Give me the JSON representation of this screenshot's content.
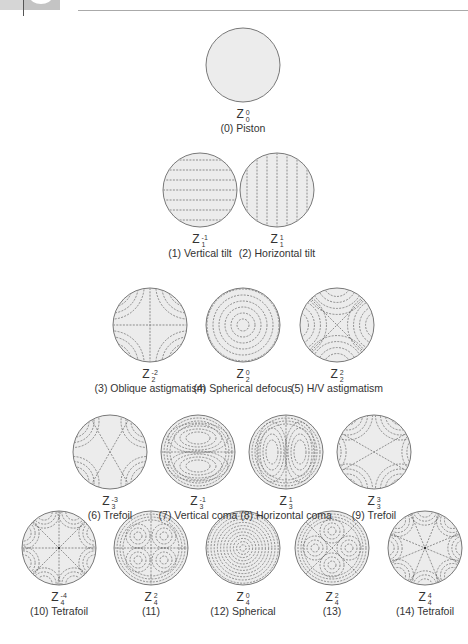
{
  "page": {
    "header": {
      "rule": true
    }
  },
  "figure": {
    "type": "zernike-pyramid",
    "symbol": "Z",
    "rows": [
      [
        {
          "index": 0,
          "m": "0",
          "n": "0",
          "caption": "(0) Piston",
          "pattern": "piston",
          "cx": 243,
          "cy": 65
        }
      ],
      [
        {
          "index": 1,
          "m": "-1",
          "n": "1",
          "caption": "(1) Vertical tilt",
          "pattern": "vtilt",
          "cx": 200,
          "cy": 190
        },
        {
          "index": 2,
          "m": "1",
          "n": "1",
          "caption": "(2) Horizontal tilt",
          "pattern": "htilt",
          "cx": 277,
          "cy": 190
        }
      ],
      [
        {
          "index": 3,
          "m": "-2",
          "n": "2",
          "caption": "(3) Oblique astigmatism",
          "pattern": "oblique-astig",
          "cx": 150,
          "cy": 325
        },
        {
          "index": 4,
          "m": "0",
          "n": "2",
          "caption": "(4) Spherical defocus",
          "pattern": "defocus",
          "cx": 243,
          "cy": 325
        },
        {
          "index": 5,
          "m": "2",
          "n": "2",
          "caption": "(5) H/V astigmatism",
          "pattern": "hv-astig",
          "cx": 337,
          "cy": 325
        }
      ],
      [
        {
          "index": 6,
          "m": "-3",
          "n": "3",
          "caption": "(6) Trefoil",
          "pattern": "trefoil-v",
          "cx": 110,
          "cy": 452
        },
        {
          "index": 7,
          "m": "-1",
          "n": "3",
          "caption": "(7) Vertical coma",
          "pattern": "vcoma",
          "cx": 198,
          "cy": 452
        },
        {
          "index": 8,
          "m": "1",
          "n": "3",
          "caption": "(8) Horizontal coma",
          "pattern": "hcoma",
          "cx": 286,
          "cy": 452
        },
        {
          "index": 9,
          "m": "3",
          "n": "3",
          "caption": "(9) Trefoil",
          "pattern": "trefoil-h",
          "cx": 374,
          "cy": 452
        }
      ],
      [
        {
          "index": 10,
          "m": "-4",
          "n": "4",
          "caption": "(10) Tetrafoil",
          "pattern": "tetrafoil-a",
          "cx": 59,
          "cy": 548
        },
        {
          "index": 11,
          "m": "2",
          "n": "4",
          "caption": "(11)",
          "pattern": "sec-astig-a",
          "cx": 151,
          "cy": 548
        },
        {
          "index": 12,
          "m": "0",
          "n": "4",
          "caption": "(12) Spherical",
          "pattern": "spherical",
          "cx": 243,
          "cy": 548
        },
        {
          "index": 13,
          "m": "2",
          "n": "4",
          "caption": "(13)",
          "pattern": "sec-astig-b",
          "cx": 332,
          "cy": 548
        },
        {
          "index": 14,
          "m": "4",
          "n": "4",
          "caption": "(14) Tetrafoil",
          "pattern": "tetrafoil-b",
          "cx": 425,
          "cy": 548
        }
      ]
    ],
    "style": {
      "circle_radius": 37,
      "fill": "#ececec",
      "stroke": "#6a6a6a",
      "dash": "#666666"
    }
  }
}
